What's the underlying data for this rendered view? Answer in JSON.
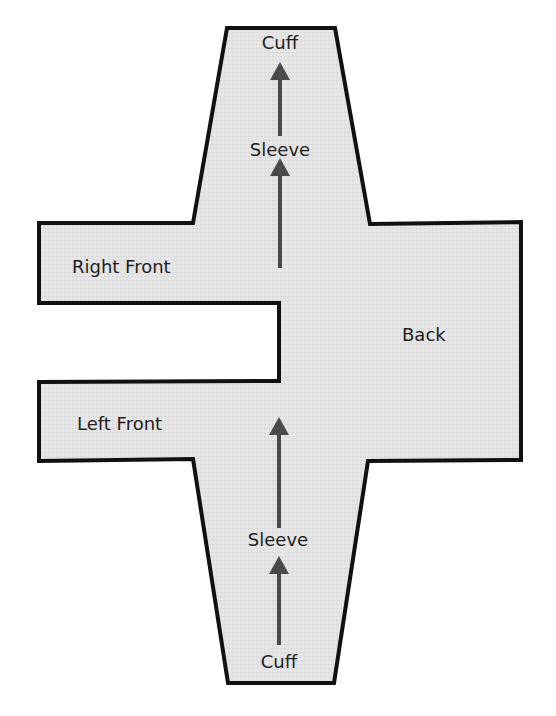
{
  "diagram": {
    "type": "garment-pattern-layout",
    "colors": {
      "fill": "#e3e3e3",
      "outline": "#111111",
      "arrow": "#4a4a4a",
      "text": "#1e1e1e",
      "background": "#ffffff"
    },
    "outline_points": "227,28 335,28 370,224 521,222 521,460 368,461 334,683 228,683 193,459 39,461 39,382 279,381 279,303 39,303 39,223 193,223",
    "labels": {
      "top_cuff": {
        "text": "Cuff",
        "x": 280,
        "y": 49
      },
      "top_sleeve": {
        "text": "Sleeve",
        "x": 280,
        "y": 156
      },
      "right_front": {
        "text": "Right Front",
        "x": 72,
        "y": 273
      },
      "back": {
        "text": "Back",
        "x": 402,
        "y": 341
      },
      "left_front": {
        "text": "Left Front",
        "x": 77,
        "y": 430
      },
      "bottom_sleeve": {
        "text": "Sleeve",
        "x": 278,
        "y": 546
      },
      "bottom_cuff": {
        "text": "Cuff",
        "x": 279,
        "y": 668
      }
    },
    "arrows": [
      {
        "name": "top-arrow-cuff",
        "x": 280,
        "tip_y": 62,
        "base_y": 136
      },
      {
        "name": "top-arrow-sleeve",
        "x": 280,
        "tip_y": 158,
        "base_y": 268
      },
      {
        "name": "bottom-arrow-sleeve",
        "x": 279,
        "tip_y": 417,
        "base_y": 528
      },
      {
        "name": "bottom-arrow-cuff",
        "x": 279,
        "tip_y": 556,
        "base_y": 645
      }
    ]
  }
}
